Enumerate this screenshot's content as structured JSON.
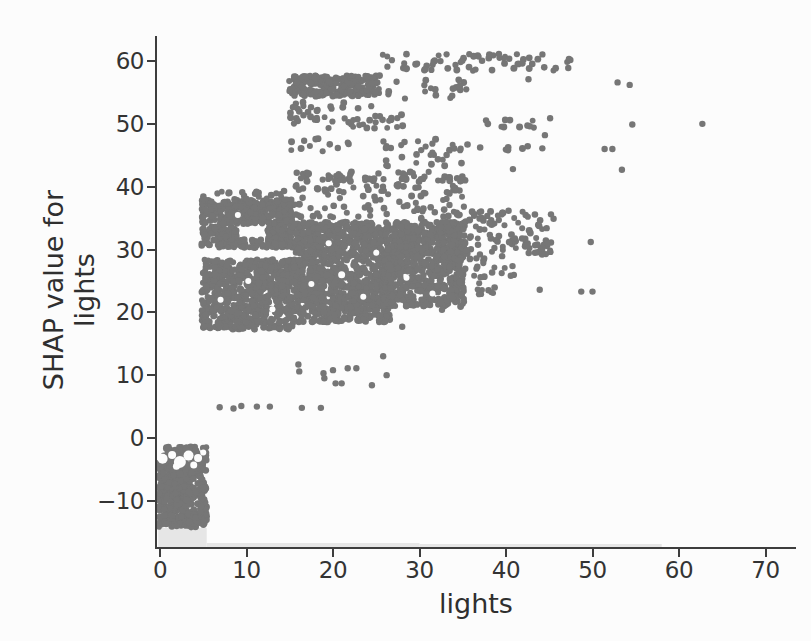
{
  "figure": {
    "background": "#fcfcfc",
    "axis_color": "#3d3d3d",
    "tick_label_color": "#333333",
    "axis_label_color": "#2f2f2f"
  },
  "chart_data": {
    "type": "scatter",
    "title": "",
    "xlabel": "lights",
    "ylabel_lines": [
      "SHAP value for",
      "lights"
    ],
    "xlim": [
      -0.35,
      73.4
    ],
    "ylim": [
      -17.3,
      64.5
    ],
    "grid": false,
    "legend": null,
    "xticks": [
      0,
      10,
      20,
      30,
      40,
      50,
      60,
      70
    ],
    "xtick_labels": [
      "0",
      "10",
      "20",
      "30",
      "40",
      "50",
      "60",
      "70"
    ],
    "yticks": [
      -10,
      0,
      10,
      20,
      30,
      40,
      50,
      60
    ],
    "ytick_labels": [
      "−10",
      "0",
      "10",
      "20",
      "30",
      "40",
      "50",
      "60"
    ],
    "point_color": "#767676",
    "point_radius": 3.2,
    "marginal_hist": {
      "color": "#e6e6e6",
      "bars": [
        {
          "x0": -0.2,
          "x1": 5.4,
          "h": 19
        },
        {
          "x0": 5.4,
          "x1": 30.0,
          "h": 4
        },
        {
          "x0": 30.0,
          "x1": 58.0,
          "h": 3
        }
      ]
    },
    "clusters": [
      {
        "name": "block-negative",
        "x0": -0.2,
        "x1": 5.4,
        "y0": -14.3,
        "y1": -1.4,
        "n": 520
      },
      {
        "name": "band-18-28",
        "x0": 4.8,
        "x1": 15.4,
        "y0": 17.3,
        "y1": 28.4,
        "n": 700
      },
      {
        "name": "band-30-31",
        "x0": 4.8,
        "x1": 15.4,
        "y0": 30.3,
        "y1": 31.6,
        "n": 110
      },
      {
        "name": "band-32-34-left",
        "x0": 4.8,
        "x1": 8.9,
        "y0": 31.6,
        "y1": 33.7,
        "n": 80
      },
      {
        "name": "band-32-34-right",
        "x0": 12.3,
        "x1": 15.4,
        "y0": 31.6,
        "y1": 33.7,
        "n": 60
      },
      {
        "name": "band-34-38",
        "x0": 4.8,
        "x1": 15.4,
        "y0": 34.1,
        "y1": 37.9,
        "n": 300
      },
      {
        "name": "edge-38-39",
        "x0": 5.0,
        "x1": 15.5,
        "y0": 37.9,
        "y1": 39.4,
        "n": 22
      },
      {
        "name": "band-mid-19-29",
        "x0": 15.4,
        "x1": 26.6,
        "y0": 18.4,
        "y1": 28.9,
        "n": 700
      },
      {
        "name": "band-29-34",
        "x0": 15.4,
        "x1": 35.3,
        "y0": 29.0,
        "y1": 34.4,
        "n": 680
      },
      {
        "name": "block-26-35-low",
        "x0": 25.6,
        "x1": 35.3,
        "y0": 20.9,
        "y1": 28.9,
        "n": 400
      },
      {
        "name": "scatter-35-40",
        "x0": 15.5,
        "x1": 35.4,
        "y0": 34.8,
        "y1": 40.4,
        "n": 95
      },
      {
        "name": "row-41-42",
        "x0": 15.4,
        "x1": 35.3,
        "y0": 40.8,
        "y1": 42.4,
        "n": 60
      },
      {
        "name": "top-band-54-58",
        "x0": 14.9,
        "x1": 25.4,
        "y0": 54.4,
        "y1": 57.7,
        "n": 230
      },
      {
        "name": "top-row-58-61",
        "x0": 25.3,
        "x1": 47.5,
        "y0": 58.4,
        "y1": 61.2,
        "n": 62
      },
      {
        "name": "left-50-53",
        "x0": 14.9,
        "x1": 18.3,
        "y0": 49.9,
        "y1": 53.6,
        "n": 22
      },
      {
        "name": "mid-49-51",
        "x0": 19.0,
        "x1": 29.0,
        "y0": 49.3,
        "y1": 51.6,
        "n": 26
      },
      {
        "name": "mid-52-54",
        "x0": 19.5,
        "x1": 25.0,
        "y0": 52.0,
        "y1": 53.8,
        "n": 6
      },
      {
        "name": "row-46-47-left",
        "x0": 14.8,
        "x1": 22.0,
        "y0": 45.6,
        "y1": 47.9,
        "n": 12
      },
      {
        "name": "row-46-47-mid",
        "x0": 25.8,
        "x1": 35.4,
        "y0": 45.4,
        "y1": 47.6,
        "n": 16
      },
      {
        "name": "row-46-right",
        "x0": 34.5,
        "x1": 42.7,
        "y0": 45.7,
        "y1": 46.9,
        "n": 9
      },
      {
        "name": "scatter-43-45",
        "x0": 26.0,
        "x1": 35.4,
        "y0": 42.8,
        "y1": 45.2,
        "n": 14
      },
      {
        "name": "v-53-57",
        "x0": 26.0,
        "x1": 32.0,
        "y0": 53.5,
        "y1": 57.0,
        "n": 10
      },
      {
        "name": "blk-33-35-top",
        "x0": 33.3,
        "x1": 35.5,
        "y0": 54.0,
        "y1": 57.3,
        "n": 9
      },
      {
        "name": "right-29-31",
        "x0": 35.3,
        "x1": 45.3,
        "y0": 28.8,
        "y1": 31.6,
        "n": 40
      },
      {
        "name": "right-31-36",
        "x0": 35.3,
        "x1": 44.2,
        "y0": 31.6,
        "y1": 36.2,
        "n": 50
      },
      {
        "name": "right-23-28",
        "x0": 35.3,
        "x1": 41.0,
        "y0": 24.5,
        "y1": 28.6,
        "n": 18
      },
      {
        "name": "row-23-24",
        "x0": 34.5,
        "x1": 39.0,
        "y0": 22.8,
        "y1": 24.3,
        "n": 8
      },
      {
        "name": "right-49-50",
        "x0": 37.4,
        "x1": 45.0,
        "y0": 49.4,
        "y1": 50.8,
        "n": 11
      }
    ],
    "holes": [
      {
        "x": 0.3,
        "y": -3.3,
        "r": 5
      },
      {
        "x": 1.4,
        "y": -2.7,
        "r": 4
      },
      {
        "x": 2.3,
        "y": -3.8,
        "r": 6
      },
      {
        "x": 3.3,
        "y": -2.8,
        "r": 5
      },
      {
        "x": 4.4,
        "y": -3.2,
        "r": 4
      },
      {
        "x": 1.9,
        "y": -4.5,
        "r": 3.5
      },
      {
        "x": 3.9,
        "y": -4.3,
        "r": 3.5
      },
      {
        "x": 5.0,
        "y": -2.3,
        "r": 3
      },
      {
        "x": 7.0,
        "y": 22.0,
        "r": 3
      },
      {
        "x": 10.2,
        "y": 25.0,
        "r": 3
      },
      {
        "x": 13.0,
        "y": 20.5,
        "r": 3
      },
      {
        "x": 9.0,
        "y": 35.5,
        "r": 3
      },
      {
        "x": 17.5,
        "y": 24.5,
        "r": 3
      },
      {
        "x": 21.0,
        "y": 26.0,
        "r": 3.5
      },
      {
        "x": 23.5,
        "y": 22.5,
        "r": 3
      },
      {
        "x": 19.5,
        "y": 31.0,
        "r": 3
      },
      {
        "x": 25.0,
        "y": 29.5,
        "r": 3
      },
      {
        "x": 28.5,
        "y": 25.5,
        "r": 3
      },
      {
        "x": 31.5,
        "y": 23.0,
        "r": 3
      }
    ],
    "points": [
      [
        6.9,
        4.9
      ],
      [
        8.5,
        4.7
      ],
      [
        9.4,
        5.1
      ],
      [
        11.2,
        5.0
      ],
      [
        12.7,
        5.0
      ],
      [
        16.4,
        4.8
      ],
      [
        18.6,
        4.8
      ],
      [
        16.0,
        11.7
      ],
      [
        16.1,
        10.6
      ],
      [
        18.9,
        10.3
      ],
      [
        19.0,
        9.5
      ],
      [
        20.0,
        10.8
      ],
      [
        20.3,
        8.7
      ],
      [
        21.0,
        8.7
      ],
      [
        21.7,
        11.1
      ],
      [
        22.7,
        11.1
      ],
      [
        24.5,
        8.4
      ],
      [
        26.2,
        10.0
      ],
      [
        25.8,
        13.0
      ],
      [
        28.0,
        17.7
      ],
      [
        32.6,
        20.4
      ],
      [
        43.9,
        23.6
      ],
      [
        48.7,
        23.3
      ],
      [
        50.0,
        23.3
      ],
      [
        49.8,
        31.2
      ],
      [
        44.8,
        31.0
      ],
      [
        44.7,
        33.4
      ],
      [
        45.2,
        35.6
      ],
      [
        45.5,
        34.9
      ],
      [
        44.5,
        48.2
      ],
      [
        44.2,
        46.1
      ],
      [
        51.4,
        46.0
      ],
      [
        52.3,
        46.0
      ],
      [
        53.4,
        42.7
      ],
      [
        40.8,
        42.8
      ],
      [
        45.1,
        50.9
      ],
      [
        54.6,
        49.9
      ],
      [
        62.7,
        50.0
      ],
      [
        52.9,
        56.6
      ],
      [
        54.3,
        56.2
      ],
      [
        47.2,
        58.9
      ],
      [
        42.6,
        57.1
      ]
    ]
  }
}
